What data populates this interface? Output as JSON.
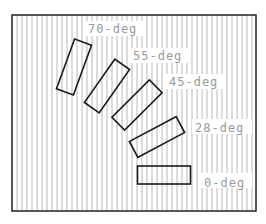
{
  "diagram": {
    "frame": {
      "x": 12,
      "y": 15,
      "width": 244,
      "height": 196,
      "stroke": "#222222"
    },
    "hatch": {
      "spacing": 5,
      "color": "#b8b8b8",
      "start_x": 17
    },
    "rect_size": {
      "long": 53,
      "short": 18
    },
    "items": [
      {
        "label": "70-deg",
        "angle": 70,
        "cx": 74,
        "cy": 67,
        "label_x": 88,
        "label_y": 33,
        "box_x": 85,
        "box_y": 21,
        "box_w": 58
      },
      {
        "label": "55-deg",
        "angle": 55,
        "cx": 107,
        "cy": 86,
        "label_x": 133,
        "label_y": 60,
        "box_x": 130,
        "box_y": 48,
        "box_w": 60
      },
      {
        "label": "45-deg",
        "angle": 45,
        "cx": 137,
        "cy": 105,
        "label_x": 169,
        "label_y": 86,
        "box_x": 166,
        "box_y": 74,
        "box_w": 60
      },
      {
        "label": "28-deg",
        "angle": 28,
        "cx": 157,
        "cy": 137,
        "label_x": 195,
        "label_y": 132,
        "box_x": 192,
        "box_y": 119,
        "box_w": 60
      },
      {
        "label": "0-deg",
        "angle": 0,
        "cx": 164,
        "cy": 175,
        "label_x": 204,
        "label_y": 187,
        "box_x": 200,
        "box_y": 173,
        "box_w": 52
      }
    ]
  }
}
